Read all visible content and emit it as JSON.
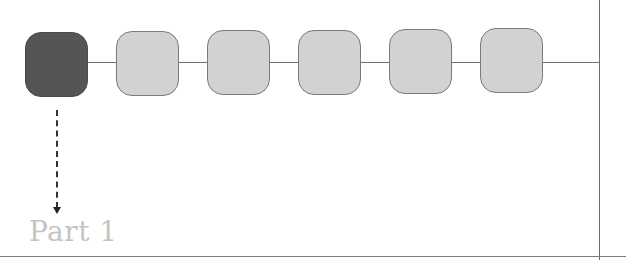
{
  "diagram": {
    "nodes": [
      {
        "id": 1,
        "state": "active",
        "x": 25,
        "y": 32
      },
      {
        "id": 2,
        "state": "inactive",
        "x": 116,
        "y": 31
      },
      {
        "id": 3,
        "state": "inactive",
        "x": 207,
        "y": 30
      },
      {
        "id": 4,
        "state": "inactive",
        "x": 298,
        "y": 30
      },
      {
        "id": 5,
        "state": "inactive",
        "x": 389,
        "y": 29
      },
      {
        "id": 6,
        "state": "inactive",
        "x": 480,
        "y": 28
      }
    ],
    "colors": {
      "active_node": "#555555",
      "inactive_node": "#d2d2d2",
      "line": "#6e6e6e",
      "label": "#c4c4c4"
    },
    "label": "Part 1"
  }
}
